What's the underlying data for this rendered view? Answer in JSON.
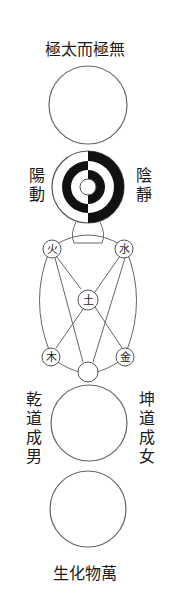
{
  "diagram": {
    "colors": {
      "background": "#ffffff",
      "stroke": "#555555",
      "ink": "#111111",
      "text": "#1a1a1a"
    },
    "top_label": "極太而極無",
    "bottom_label": "生化物萬",
    "yin_yang": {
      "left_label": "陽動",
      "right_label": "陰靜"
    },
    "five_elements": {
      "fire": "火",
      "water": "水",
      "earth": "土",
      "wood": "木",
      "metal": "金"
    },
    "qian_label": "乾道成男",
    "kun_label": "坤道成女",
    "stages": [
      {
        "name": "wuji-circle",
        "description": "empty circle"
      },
      {
        "name": "yin-yang-circle",
        "description": "concentric half black half white rings"
      },
      {
        "name": "five-elements",
        "description": "five element nodes with connecting lines"
      },
      {
        "name": "qian-kun-circle",
        "description": "empty circle"
      },
      {
        "name": "myriad-things-circle",
        "description": "empty circle"
      }
    ]
  }
}
